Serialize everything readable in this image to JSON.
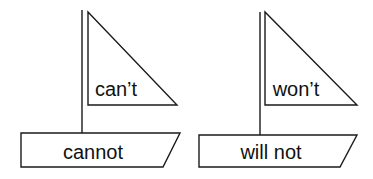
{
  "diagram": {
    "boats": [
      {
        "sail_label": "can’t",
        "hull_label": "cannot"
      },
      {
        "sail_label": "won’t",
        "hull_label": "will not"
      }
    ],
    "colors": {
      "stroke": "#1a1a1a",
      "background": "#ffffff",
      "text": "#111111"
    }
  }
}
